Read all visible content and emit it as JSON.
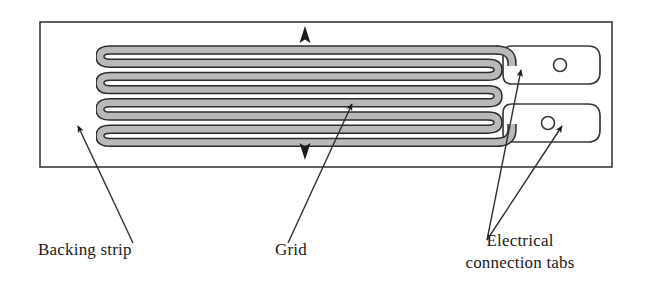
{
  "figure": {
    "width": 645,
    "height": 307,
    "background_color": "#ffffff"
  },
  "labels": {
    "backing_strip": "Backing strip",
    "grid": "Grid",
    "tabs_line1": "Electrical",
    "tabs_line2": "connection tabs"
  },
  "colors": {
    "outline": "#3a3a3a",
    "trace_dark": "#2b2b2b",
    "trace_fill": "#b4b4b4",
    "leader_line": "#2e2e2e",
    "arrow_fill": "#1c1c1c",
    "text": "#1a1a1a"
  },
  "backing_strip": {
    "x": 40,
    "y": 22,
    "width": 572,
    "height": 145,
    "stroke_width": 1.6
  },
  "grid": {
    "trace_count": 7,
    "left_loop_count": 7,
    "right_loop_count": 6,
    "left_x": 100,
    "right_x": 498,
    "top_y": 50,
    "row_spacing": 13.2,
    "trace_width": 7.5,
    "orientation": "horizontal serpentine, strain axis vertical"
  },
  "strain_arrows": {
    "up": {
      "x": 305,
      "y": 31,
      "direction": "up"
    },
    "down": {
      "x": 305,
      "y": 152,
      "direction": "down"
    }
  },
  "tabs": [
    {
      "name": "upper-tab",
      "x": 512,
      "y": 46,
      "width": 88,
      "height": 38,
      "hole_cx": 560,
      "hole_cy": 65,
      "hole_r": 6.5
    },
    {
      "name": "lower-tab",
      "x": 512,
      "y": 104,
      "width": 88,
      "height": 38,
      "hole_cx": 548,
      "hole_cy": 123,
      "hole_r": 6.5
    }
  ],
  "leaders": [
    {
      "name": "backing-strip-leader",
      "from_x": 133,
      "from_y": 243,
      "to_x": 78,
      "to_y": 126
    },
    {
      "name": "grid-leader",
      "from_x": 288,
      "from_y": 243,
      "to_x": 352,
      "to_y": 104
    },
    {
      "name": "upper-tab-leader",
      "from_x": 487,
      "from_y": 240,
      "to_x": 521,
      "to_y": 70
    },
    {
      "name": "lower-tab-leader",
      "from_x": 487,
      "from_y": 240,
      "to_x": 562,
      "to_y": 126
    }
  ]
}
